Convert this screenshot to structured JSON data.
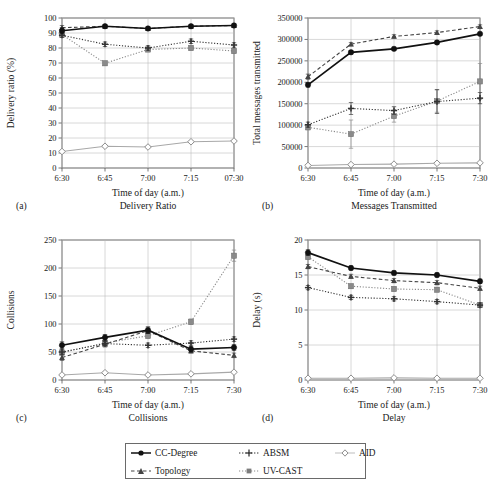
{
  "figure": {
    "panels": [
      {
        "letter": "(a)",
        "caption": "Delivery Ratio"
      },
      {
        "letter": "(b)",
        "caption": "Messages Transmitted"
      },
      {
        "letter": "(c)",
        "caption": "Collisions"
      },
      {
        "letter": "(d)",
        "caption": "Delay"
      }
    ]
  },
  "legend": {
    "position": "bottom-center",
    "entries": [
      {
        "label": "CC-Degree",
        "marker": "filled-circle",
        "line": "solid",
        "color": "#111111"
      },
      {
        "label": "ABSM",
        "marker": "plus",
        "line": "dotted",
        "color": "#333333"
      },
      {
        "label": "AID",
        "marker": "open-diamond",
        "line": "solid",
        "color": "#a8a8a8"
      },
      {
        "label": "Topology",
        "marker": "filled-triangle",
        "line": "dashed",
        "color": "#444444"
      },
      {
        "label": "UV-CAST",
        "marker": "filled-square",
        "line": "dotted",
        "color": "#8a8a8a"
      }
    ]
  },
  "chart_data": [
    {
      "type": "line",
      "panel": "(a)",
      "title": "Delivery Ratio",
      "xlabel": "Time of day (a.m.)",
      "ylabel": "Delivery ratio (%)",
      "x": [
        "6:30",
        "6:45",
        "7:00",
        "7:15",
        "07:30"
      ],
      "ylim": [
        0,
        100
      ],
      "yticks": [
        0,
        10,
        20,
        30,
        40,
        50,
        60,
        70,
        80,
        90,
        100
      ],
      "grid": true,
      "series": [
        {
          "name": "CC-Degree",
          "marker": "filled-circle",
          "line": "solid",
          "color": "#111111",
          "values": [
            91.5,
            94.5,
            93.0,
            94.5,
            95.0
          ],
          "err": [
            2.0,
            1.0,
            1.0,
            1.0,
            1.0
          ]
        },
        {
          "name": "Topology",
          "marker": "filled-triangle",
          "line": "dashed",
          "color": "#444444",
          "values": [
            93.5,
            94.5,
            93.0,
            94.5,
            95.0
          ],
          "err": [
            1.5,
            1.0,
            1.0,
            1.0,
            1.0
          ]
        },
        {
          "name": "ABSM",
          "marker": "plus",
          "line": "dotted",
          "color": "#333333",
          "values": [
            88.5,
            82.5,
            80.0,
            84.5,
            82.0
          ],
          "err": [
            1.5,
            1.5,
            1.5,
            1.5,
            1.5
          ]
        },
        {
          "name": "UV-CAST",
          "marker": "filled-square",
          "line": "dotted",
          "color": "#8a8a8a",
          "values": [
            89.0,
            69.8,
            79.0,
            80.0,
            78.0
          ],
          "err": [
            1.5,
            1.5,
            1.5,
            1.5,
            1.5
          ]
        },
        {
          "name": "AID",
          "marker": "open-diamond",
          "line": "solid",
          "color": "#a8a8a8",
          "values": [
            11.0,
            14.5,
            14.0,
            17.5,
            18.0
          ],
          "err": [
            0.8,
            0.8,
            0.8,
            0.8,
            0.8
          ]
        }
      ]
    },
    {
      "type": "line",
      "panel": "(b)",
      "title": "Messages Transmitted",
      "xlabel": "Time of day (a.m.)",
      "ylabel": "Total messages transmitted",
      "x": [
        "6:30",
        "6:45",
        "7:00",
        "7:15",
        "7:30"
      ],
      "ylim": [
        0,
        350000
      ],
      "yticks": [
        0,
        50000,
        100000,
        150000,
        200000,
        250000,
        300000,
        350000
      ],
      "grid": true,
      "series": [
        {
          "name": "Topology",
          "marker": "filled-triangle",
          "line": "dashed",
          "color": "#444444",
          "values": [
            213000,
            289000,
            307000,
            316000,
            330000
          ],
          "err": [
            6000,
            4000,
            4000,
            4000,
            4000
          ]
        },
        {
          "name": "CC-Degree",
          "marker": "filled-circle",
          "line": "solid",
          "color": "#111111",
          "values": [
            194000,
            270000,
            278000,
            293000,
            313000
          ],
          "err": [
            5000,
            4000,
            4000,
            4000,
            4000
          ]
        },
        {
          "name": "ABSM",
          "marker": "plus",
          "line": "dotted",
          "color": "#333333",
          "values": [
            101000,
            139000,
            134000,
            155000,
            163000
          ],
          "err": [
            6000,
            14000,
            9000,
            28000,
            13000
          ]
        },
        {
          "name": "UV-CAST",
          "marker": "filled-square",
          "line": "dotted",
          "color": "#8a8a8a",
          "values": [
            95000,
            79000,
            121000,
            156000,
            202000
          ],
          "err": [
            6000,
            33000,
            14000,
            26000,
            42000
          ]
        },
        {
          "name": "AID",
          "marker": "open-diamond",
          "line": "solid",
          "color": "#a8a8a8",
          "values": [
            6000,
            8000,
            9000,
            11000,
            12000
          ],
          "err": [
            1500,
            1500,
            1500,
            1500,
            1500
          ]
        }
      ]
    },
    {
      "type": "line",
      "panel": "(c)",
      "title": "Collisions",
      "xlabel": "Time of day (a.m.)",
      "ylabel": "Collisions",
      "x": [
        "6:30",
        "6:45",
        "7:00",
        "7:15",
        "7:30"
      ],
      "ylim": [
        0,
        250
      ],
      "yticks": [
        0,
        50,
        100,
        150,
        200,
        250
      ],
      "grid": true,
      "series": [
        {
          "name": "UV-CAST",
          "marker": "filled-square",
          "line": "dotted",
          "color": "#8a8a8a",
          "values": [
            49,
            66,
            79,
            104,
            222
          ],
          "err": [
            4,
            4,
            5,
            5,
            10
          ]
        },
        {
          "name": "CC-Degree",
          "marker": "filled-circle",
          "line": "solid",
          "color": "#111111",
          "values": [
            62,
            76,
            89,
            55,
            58
          ],
          "err": [
            6,
            5,
            6,
            5,
            5
          ]
        },
        {
          "name": "ABSM",
          "marker": "plus",
          "line": "dotted",
          "color": "#333333",
          "values": [
            50,
            65,
            62,
            66,
            73
          ],
          "err": [
            4,
            4,
            4,
            4,
            4
          ]
        },
        {
          "name": "Topology",
          "marker": "filled-triangle",
          "line": "dashed",
          "color": "#444444",
          "values": [
            40,
            64,
            88,
            52,
            44
          ],
          "err": [
            5,
            5,
            5,
            4,
            4
          ]
        },
        {
          "name": "AID",
          "marker": "open-diamond",
          "line": "solid",
          "color": "#a8a8a8",
          "values": [
            9,
            13,
            9,
            11,
            14
          ],
          "err": [
            2,
            2,
            2,
            2,
            2
          ]
        }
      ]
    },
    {
      "type": "line",
      "panel": "(d)",
      "title": "Delay",
      "xlabel": "Time of day (a.m.)",
      "ylabel": "Delay (s)",
      "x": [
        "6:30",
        "6:45",
        "7:00",
        "7:15",
        "7:30"
      ],
      "ylim": [
        0,
        20
      ],
      "yticks": [
        0,
        5,
        10,
        15,
        20
      ],
      "grid": true,
      "series": [
        {
          "name": "CC-Degree",
          "marker": "filled-circle",
          "line": "solid",
          "color": "#111111",
          "values": [
            18.2,
            16.0,
            15.3,
            15.0,
            14.1
          ],
          "err": [
            0.4,
            0.3,
            0.3,
            0.3,
            0.3
          ]
        },
        {
          "name": "UV-CAST",
          "marker": "filled-square",
          "line": "dotted",
          "color": "#8a8a8a",
          "values": [
            17.6,
            13.4,
            13.0,
            12.9,
            10.7
          ],
          "err": [
            0.4,
            0.3,
            0.3,
            0.3,
            0.3
          ]
        },
        {
          "name": "Topology",
          "marker": "filled-triangle",
          "line": "dashed",
          "color": "#444444",
          "values": [
            16.2,
            14.8,
            14.2,
            13.9,
            13.1
          ],
          "err": [
            0.3,
            0.3,
            0.3,
            0.3,
            0.3
          ]
        },
        {
          "name": "ABSM",
          "marker": "plus",
          "line": "dotted",
          "color": "#333333",
          "values": [
            13.2,
            11.8,
            11.6,
            11.2,
            10.7
          ],
          "err": [
            0.3,
            0.3,
            0.3,
            0.3,
            0.3
          ]
        },
        {
          "name": "AID",
          "marker": "open-diamond",
          "line": "solid",
          "color": "#a8a8a8",
          "values": [
            0.25,
            0.25,
            0.3,
            0.25,
            0.25
          ],
          "err": [
            0.1,
            0.1,
            0.1,
            0.1,
            0.1
          ]
        }
      ]
    }
  ]
}
